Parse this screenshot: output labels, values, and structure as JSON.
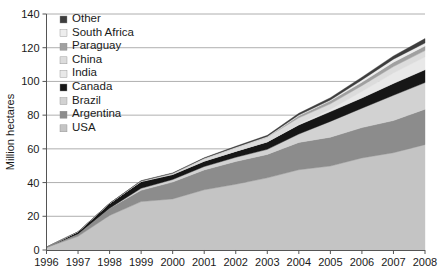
{
  "chart_data": {
    "type": "area",
    "stacked": true,
    "title": "",
    "subtitle": "",
    "xlabel": "",
    "ylabel": "Million hectares",
    "x": [
      1996,
      1997,
      1998,
      1999,
      2000,
      2001,
      2002,
      2003,
      2004,
      2005,
      2006,
      2007,
      2008
    ],
    "categories": [
      "1996",
      "1997",
      "1998",
      "1999",
      "2000",
      "2001",
      "2002",
      "2003",
      "2004",
      "2005",
      "2006",
      "2007",
      "2008"
    ],
    "xlim": [
      1996,
      2008
    ],
    "ylim": [
      0,
      140
    ],
    "yticks": [
      0,
      20,
      40,
      60,
      80,
      100,
      120,
      140
    ],
    "xticks": [
      1996,
      1997,
      1998,
      1999,
      2000,
      2001,
      2002,
      2003,
      2004,
      2005,
      2006,
      2007,
      2008
    ],
    "grid": "horizontal",
    "legend_position": "upper-left-inside",
    "stack_order_bottom_to_top": [
      "USA",
      "Argentina",
      "Brazil",
      "Canada",
      "India",
      "China",
      "Paraguay",
      "South Africa",
      "Other"
    ],
    "series": [
      {
        "name": "USA",
        "color": "#c4c4c4",
        "values": [
          1.5,
          8.1,
          20.5,
          28.7,
          30.3,
          35.7,
          39.0,
          42.8,
          47.6,
          49.8,
          54.6,
          57.7,
          62.5
        ]
      },
      {
        "name": "Argentina",
        "color": "#8c8c8c",
        "values": [
          0.1,
          1.4,
          4.3,
          6.7,
          10.0,
          11.8,
          13.5,
          13.9,
          16.2,
          17.1,
          18.0,
          19.1,
          21.0
        ]
      },
      {
        "name": "Brazil",
        "color": "#d2d2d2",
        "values": [
          0.0,
          0.0,
          0.0,
          1.2,
          1.5,
          2.0,
          2.5,
          3.0,
          5.0,
          9.4,
          11.5,
          15.0,
          15.8
        ]
      },
      {
        "name": "Canada",
        "color": "#161616",
        "values": [
          0.1,
          1.3,
          2.8,
          4.0,
          3.0,
          3.2,
          3.5,
          4.4,
          5.4,
          5.8,
          6.1,
          7.0,
          7.6
        ]
      },
      {
        "name": "India",
        "color": "#e8e8e8",
        "values": [
          0.0,
          0.0,
          0.0,
          0.0,
          0.0,
          0.0,
          0.1,
          0.1,
          0.5,
          1.3,
          3.8,
          6.2,
          7.6
        ]
      },
      {
        "name": "China",
        "color": "#dcdcdc",
        "values": [
          0.0,
          0.0,
          0.0,
          0.3,
          0.5,
          1.5,
          2.1,
          2.8,
          3.7,
          3.3,
          3.5,
          3.8,
          3.8
        ]
      },
      {
        "name": "Paraguay",
        "color": "#a0a0a0",
        "values": [
          0.0,
          0.0,
          0.0,
          0.0,
          0.0,
          0.0,
          0.0,
          0.0,
          1.2,
          1.8,
          2.0,
          2.6,
          2.7
        ]
      },
      {
        "name": "South Africa",
        "color": "#ededed",
        "values": [
          0.0,
          0.0,
          0.0,
          0.1,
          0.2,
          0.2,
          0.3,
          0.4,
          0.5,
          0.5,
          1.4,
          1.8,
          1.8
        ]
      },
      {
        "name": "Other",
        "color": "#3d3d3d",
        "values": [
          0.0,
          0.0,
          0.1,
          0.1,
          0.2,
          0.3,
          0.5,
          0.6,
          1.0,
          1.3,
          1.6,
          1.9,
          2.6
        ]
      }
    ],
    "totals": [
      1.7,
      11.0,
      27.8,
      39.9,
      44.2,
      52.6,
      58.7,
      67.7,
      81.0,
      90.0,
      102.0,
      114.3,
      125.0
    ],
    "legend_entries_top_to_bottom": [
      {
        "label": "Other",
        "color": "#3d3d3d"
      },
      {
        "label": "South Africa",
        "color": "#ededed"
      },
      {
        "label": "Paraguay",
        "color": "#a0a0a0"
      },
      {
        "label": "China",
        "color": "#dcdcdc"
      },
      {
        "label": "India",
        "color": "#e8e8e8"
      },
      {
        "label": "Canada",
        "color": "#161616"
      },
      {
        "label": "Brazil",
        "color": "#d2d2d2"
      },
      {
        "label": "Argentina",
        "color": "#8c8c8c"
      },
      {
        "label": "USA",
        "color": "#c4c4c4"
      }
    ]
  },
  "axes": {
    "y_title": "Million hectares",
    "y_tick_labels": [
      "0",
      "20",
      "40",
      "60",
      "80",
      "100",
      "120",
      "140"
    ],
    "x_tick_labels": [
      "1996",
      "1997",
      "1998",
      "1999",
      "2000",
      "2001",
      "2002",
      "2003",
      "2004",
      "2005",
      "2006",
      "2007",
      "2008"
    ]
  },
  "legend": {
    "items": [
      {
        "label": "Other"
      },
      {
        "label": "South Africa"
      },
      {
        "label": "Paraguay"
      },
      {
        "label": "China"
      },
      {
        "label": "India"
      },
      {
        "label": "Canada"
      },
      {
        "label": "Brazil"
      },
      {
        "label": "Argentina"
      },
      {
        "label": "USA"
      }
    ]
  },
  "colors": {
    "axis": "#555555",
    "grid": "#9a9a9a",
    "text": "#1a1a1a",
    "background": "#ffffff"
  }
}
